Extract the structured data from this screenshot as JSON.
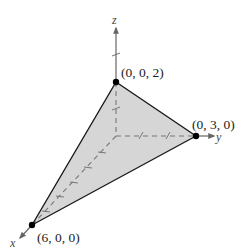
{
  "diagram": {
    "type": "3d-plane-intercepts",
    "axes": {
      "x": {
        "label": "x"
      },
      "y": {
        "label": "y"
      },
      "z": {
        "label": "z"
      }
    },
    "points": [
      {
        "name": "z-intercept",
        "label": "(0, 0, 2)"
      },
      {
        "name": "y-intercept",
        "label": "(0, 3, 0)"
      },
      {
        "name": "x-intercept",
        "label": "(6, 0, 0)"
      }
    ],
    "colors": {
      "fill": "#d6d6d6",
      "edge": "#1a1a1a",
      "axis": "#666666",
      "point": "#000000"
    }
  }
}
